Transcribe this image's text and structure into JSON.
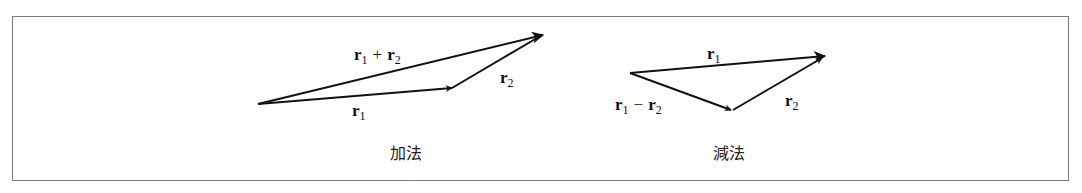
{
  "addition": {
    "caption": "加法",
    "vectors": {
      "r1": {
        "base": "r",
        "sub": "1"
      },
      "r2": {
        "base": "r",
        "sub": "2"
      },
      "sum": {
        "left": {
          "base": "r",
          "sub": "1"
        },
        "operator": "+",
        "right": {
          "base": "r",
          "sub": "2"
        }
      }
    }
  },
  "subtraction": {
    "caption": "減法",
    "vectors": {
      "r1": {
        "base": "r",
        "sub": "1"
      },
      "r2": {
        "base": "r",
        "sub": "2"
      },
      "difference": {
        "left": {
          "base": "r",
          "sub": "1"
        },
        "operator": "−",
        "right": {
          "base": "r",
          "sub": "2"
        }
      }
    }
  },
  "colors": {
    "stroke": "#111111",
    "frame": "#7a7a7a"
  }
}
